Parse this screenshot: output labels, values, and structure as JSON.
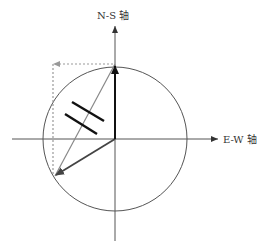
{
  "diagram": {
    "type": "vector-phasor-diagram",
    "axes": {
      "vertical_label": "N-S 轴",
      "horizontal_label": "E-W 轴"
    },
    "elements": {
      "reference_circle": "circle centered at origin",
      "vertical_vector": "black arrow from origin pointing North along N-S axis",
      "rotated_vector": "dark gray arrow from origin pointing toward lower-left (south-west)",
      "chord": "gray line connecting tips of the two vectors",
      "equal_marks": "double hatch marks (=) crossing the chord",
      "projection": "dotted gray line with arrow projecting the vertical vector tip horizontally, then vertical dotted line down to rotated vector tip"
    },
    "colors": {
      "axis": "#555555",
      "circle": "#555555",
      "vertical_vector": "#111111",
      "rotated_vector": "#444444",
      "chord": "#888888",
      "dotted": "#999999",
      "hatch": "#111111"
    }
  }
}
